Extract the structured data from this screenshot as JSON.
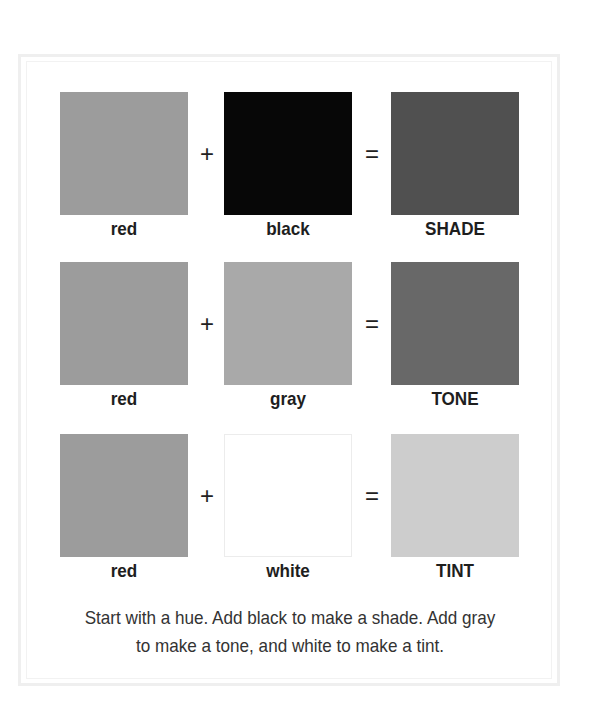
{
  "rows": [
    {
      "a": {
        "label": "red",
        "color": "#9c9c9c"
      },
      "op1": "+",
      "b": {
        "label": "black",
        "color": "#070707"
      },
      "op2": "=",
      "result": {
        "label": "SHADE",
        "color": "#505050"
      }
    },
    {
      "a": {
        "label": "red",
        "color": "#9c9c9c"
      },
      "op1": "+",
      "b": {
        "label": "gray",
        "color": "#a9a9a9"
      },
      "op2": "=",
      "result": {
        "label": "TONE",
        "color": "#686868"
      }
    },
    {
      "a": {
        "label": "red",
        "color": "#9c9c9c"
      },
      "op1": "+",
      "b": {
        "label": "white",
        "color": "#ffffff"
      },
      "op2": "=",
      "result": {
        "label": "TINT",
        "color": "#cdcdcd"
      }
    }
  ],
  "caption": "Start with a hue. Add black to make a shade. Add gray to make a tone, and white to make a tint."
}
